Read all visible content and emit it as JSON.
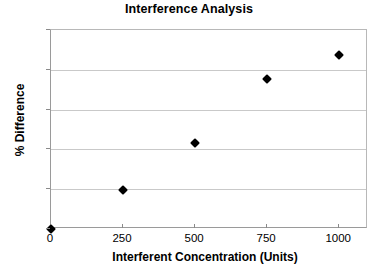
{
  "chart_data": {
    "type": "scatter",
    "title": "Interference Analysis",
    "xlabel": "Interferent Concentration (Units)",
    "ylabel": "% Difference",
    "x": [
      0,
      250,
      500,
      750,
      1000
    ],
    "values": [
      0,
      4.9,
      10.8,
      18.8,
      21.8
    ],
    "series": [
      {
        "name": "% Difference",
        "points": [
          {
            "x": 0,
            "y": 0
          },
          {
            "x": 250,
            "y": 4.9
          },
          {
            "x": 500,
            "y": 10.8
          },
          {
            "x": 750,
            "y": 18.8
          },
          {
            "x": 1000,
            "y": 21.8
          }
        ]
      }
    ],
    "xlim": [
      0,
      1100
    ],
    "ylim": [
      0,
      25
    ],
    "xticks": [
      0,
      250,
      500,
      750,
      1000
    ],
    "xtick_labels": [
      "0",
      "250",
      "500",
      "750",
      "1000"
    ],
    "yticks": [
      0,
      5,
      10,
      15,
      20,
      25
    ],
    "ytick_labels": [
      "0",
      "5",
      "10",
      "15",
      "20",
      "25"
    ],
    "grid": "horizontal",
    "legend": "none",
    "marker": "diamond",
    "marker_color": "#000000",
    "gridline_color": "#c9c9c9",
    "axis_color": "#9a9a9a",
    "background": "#ffffff"
  }
}
